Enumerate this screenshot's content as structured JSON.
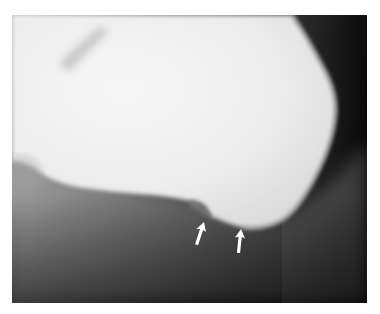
{
  "image": {
    "subject": "lateral radiograph of heel (calcaneus)",
    "frame": {
      "x": 12,
      "y": 15,
      "width": 355,
      "height": 288
    },
    "colors": {
      "page_background": "#ffffff",
      "bone": "#efefef",
      "soft_tissue": "#8a8a8a",
      "background_dark": "#141414",
      "arrow": "#ffffff"
    },
    "annotations": [
      {
        "type": "arrow",
        "direction": "up-right",
        "tip": {
          "x": 211,
          "y": 222
        },
        "tail": {
          "x": 204,
          "y": 244
        }
      },
      {
        "type": "arrow",
        "direction": "up",
        "tip": {
          "x": 242,
          "y": 229
        },
        "tail": {
          "x": 239,
          "y": 252
        }
      }
    ]
  }
}
